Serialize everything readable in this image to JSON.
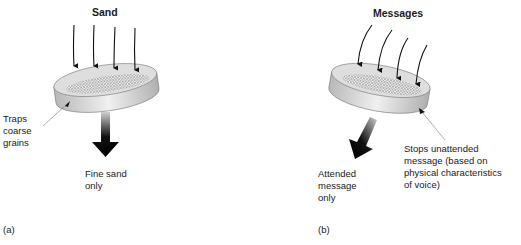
{
  "panel_a": {
    "title": "Sand",
    "side_label": "Traps\ncoarse\ngrains",
    "output_label": "Fine sand\nonly",
    "panel_label": "(a)"
  },
  "panel_b": {
    "title": "Messages",
    "side_label": "Stops unattended\nmessage (based on\nphysical characteristics\nof voice)",
    "output_label": "Attended\nmessage\nonly",
    "panel_label": "(b)"
  },
  "colors": {
    "arrow": "#111111",
    "sieve_rim": "#c8c8c8",
    "sieve_top": "#dcdcdc",
    "mesh": "#9a9a9a"
  }
}
